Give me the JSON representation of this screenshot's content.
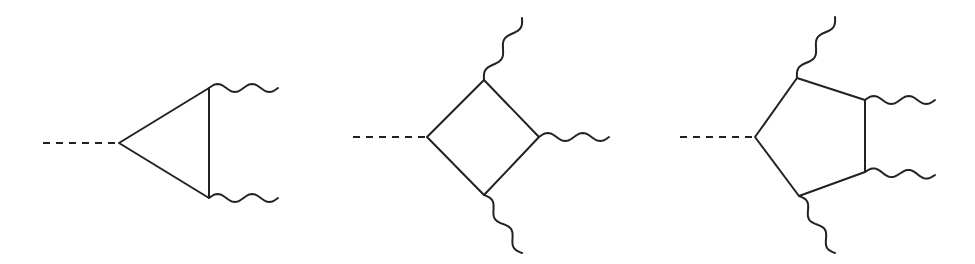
{
  "style": {
    "line_color": "#222222",
    "background": "#ffffff",
    "line_width": 2,
    "dash_pattern": "7 6",
    "wave_amplitude": 4,
    "wave_length": 32
  },
  "diagrams": [
    {
      "name": "triangle-loop",
      "scalar_leg": {
        "from": [
          43,
          143
        ],
        "to": [
          119,
          143
        ]
      },
      "loop_vertices": [
        [
          119,
          143
        ],
        [
          209,
          88
        ],
        [
          209,
          198
        ]
      ],
      "photon_legs": [
        {
          "from": [
            209,
            88
          ],
          "to": [
            278,
            88
          ]
        },
        {
          "from": [
            209,
            198
          ],
          "to": [
            278,
            198
          ]
        }
      ]
    },
    {
      "name": "box-loop",
      "scalar_leg": {
        "from": [
          353,
          137
        ],
        "to": [
          427,
          137
        ]
      },
      "loop_vertices": [
        [
          427,
          137
        ],
        [
          484,
          80
        ],
        [
          539,
          137
        ],
        [
          484,
          195
        ]
      ],
      "photon_legs": [
        {
          "from": [
            484,
            80
          ],
          "to": [
            522,
            18
          ]
        },
        {
          "from": [
            539,
            137
          ],
          "to": [
            609,
            137
          ]
        },
        {
          "from": [
            484,
            195
          ],
          "to": [
            522,
            253
          ]
        }
      ]
    },
    {
      "name": "pentagon-loop",
      "scalar_leg": {
        "from": [
          680,
          137
        ],
        "to": [
          755,
          137
        ]
      },
      "loop_vertices": [
        [
          755,
          137
        ],
        [
          797,
          78
        ],
        [
          865,
          100
        ],
        [
          865,
          172
        ],
        [
          799,
          196
        ]
      ],
      "photon_legs": [
        {
          "from": [
            797,
            78
          ],
          "to": [
            835,
            17
          ]
        },
        {
          "from": [
            865,
            100
          ],
          "to": [
            935,
            100
          ]
        },
        {
          "from": [
            865,
            172
          ],
          "to": [
            935,
            175
          ]
        },
        {
          "from": [
            799,
            196
          ],
          "to": [
            835,
            253
          ]
        }
      ]
    }
  ]
}
